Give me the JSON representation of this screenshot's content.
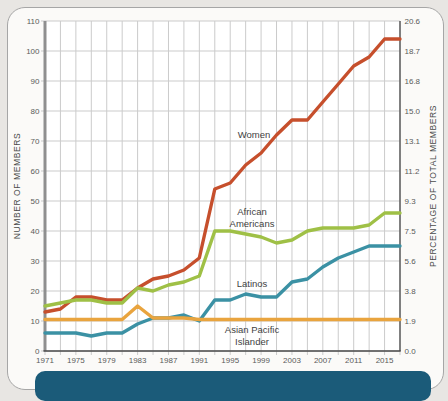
{
  "page": {
    "background_color": "#e8e6e3",
    "card_background": "#fbfaf8",
    "card_border_color": "#a6a6a6",
    "caption_bar_color": "#1b5b79"
  },
  "chart_data": {
    "type": "line",
    "title": "",
    "grid": true,
    "x": [
      1971,
      1973,
      1975,
      1977,
      1979,
      1981,
      1983,
      1985,
      1987,
      1989,
      1991,
      1993,
      1995,
      1997,
      1999,
      2001,
      2003,
      2005,
      2007,
      2009,
      2011,
      2013,
      2015,
      2017
    ],
    "series": [
      {
        "name": "Women",
        "color": "#c64f2c",
        "values": [
          13,
          14,
          18,
          18,
          17,
          17,
          21,
          24,
          25,
          27,
          31,
          54,
          56,
          62,
          66,
          72,
          77,
          77,
          83,
          89,
          95,
          98,
          104,
          104
        ]
      },
      {
        "name": "African Americans",
        "color": "#9fc046",
        "values": [
          15,
          16,
          17,
          17,
          16,
          16,
          21,
          20,
          22,
          23,
          25,
          40,
          40,
          39,
          38,
          36,
          37,
          40,
          41,
          41,
          41,
          42,
          46,
          46
        ]
      },
      {
        "name": "Latinos",
        "color": "#3b91a4",
        "values": [
          6,
          6,
          6,
          5,
          6,
          6,
          9,
          11,
          11,
          12,
          10,
          17,
          17,
          19,
          18,
          18,
          23,
          24,
          28,
          31,
          33,
          35,
          35,
          35
        ]
      },
      {
        "name": "Asian Pacific Islander",
        "color": "#e9a43e",
        "values": [
          10.5,
          10.5,
          10.5,
          10.5,
          10.5,
          10.5,
          15,
          11,
          11,
          11,
          10.5,
          10.5,
          10.5,
          10.5,
          10.5,
          10.5,
          10.5,
          10.5,
          10.5,
          10.5,
          10.5,
          10.5,
          10.5,
          10.5
        ]
      }
    ],
    "y_axis_left": {
      "label": "NUMBER OF MEMBERS",
      "ticks": [
        0,
        10,
        20,
        30,
        40,
        50,
        60,
        70,
        80,
        90,
        100,
        110
      ],
      "range": [
        0,
        110
      ]
    },
    "y_axis_right": {
      "label": "PERCENTAGE OF TOTAL MEMBERS",
      "ticks": [
        "0.0",
        "1.9",
        "3.8",
        "5.6",
        "7.5",
        "9.3",
        "11.2",
        "13.1",
        "15.0",
        "16.8",
        "18.7",
        "20.6"
      ]
    },
    "x_axis": {
      "tick_labels": [
        "1971",
        "1975",
        "1979",
        "1983",
        "1987",
        "1991",
        "1995",
        "1999",
        "2003",
        "2007",
        "2011",
        "2015"
      ],
      "range": [
        1971,
        2017
      ]
    },
    "annotations": [
      {
        "text": "Women"
      },
      {
        "text": "African\nAmericans"
      },
      {
        "text": "Latinos"
      },
      {
        "text": "Asian Pacific\nIslander"
      }
    ]
  }
}
